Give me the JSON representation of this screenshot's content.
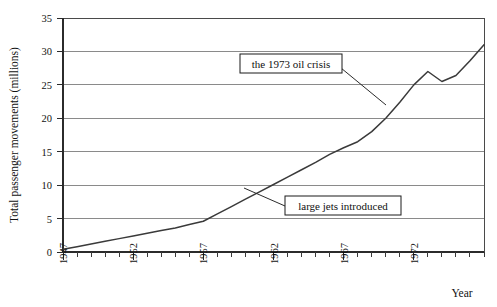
{
  "chart_data": {
    "type": "line",
    "title": "",
    "xlabel": "Year",
    "ylabel": "Total passenger movements (millions)",
    "xlim": [
      1947,
      1977
    ],
    "ylim": [
      0,
      35
    ],
    "yticks": [
      0,
      5,
      10,
      15,
      20,
      25,
      30,
      35
    ],
    "xticks_major": [
      1947,
      1952,
      1957,
      1962,
      1967,
      1972
    ],
    "xtick_minor_step": 1,
    "grid": "horizontal",
    "legend": "none",
    "x": [
      1947,
      1948,
      1949,
      1950,
      1951,
      1952,
      1953,
      1954,
      1955,
      1956,
      1957,
      1958,
      1959,
      1960,
      1961,
      1962,
      1963,
      1964,
      1965,
      1966,
      1967,
      1968,
      1969,
      1970,
      1971,
      1972,
      1973,
      1974,
      1975,
      1976,
      1977
    ],
    "values": [
      0.4,
      0.8,
      1.2,
      1.6,
      2.0,
      2.4,
      2.8,
      3.2,
      3.6,
      4.1,
      4.6,
      5.7,
      6.8,
      7.9,
      9.0,
      10.1,
      11.2,
      12.3,
      13.4,
      14.6,
      15.6,
      16.5,
      18.0,
      20.0,
      22.4,
      25.0,
      27.0,
      25.5,
      26.4,
      28.6,
      31.0
    ],
    "annotations": [
      {
        "id": "oil-crisis",
        "text": "the 1973 oil crisis",
        "target_year": 1973,
        "target_value": 22.0
      },
      {
        "id": "large-jets",
        "text": "large jets introduced",
        "target_year": 1958,
        "target_value": 6.0
      }
    ]
  },
  "axes": {
    "y_title": "Total passenger movements (millions)",
    "x_title": "Year",
    "y_tick_labels": [
      "0",
      "5",
      "10",
      "15",
      "20",
      "25",
      "30",
      "35"
    ],
    "x_tick_labels": [
      "1947",
      "1952",
      "1957",
      "1962",
      "1967",
      "1972"
    ]
  },
  "annotations": {
    "oil_crisis_label": "the 1973 oil crisis",
    "large_jets_label": "large jets introduced"
  },
  "colors": {
    "line": "#3a3a3a",
    "grid": "#8a8a8a",
    "axis": "#2b2b2b",
    "background": "#ffffff",
    "text": "#111111"
  }
}
